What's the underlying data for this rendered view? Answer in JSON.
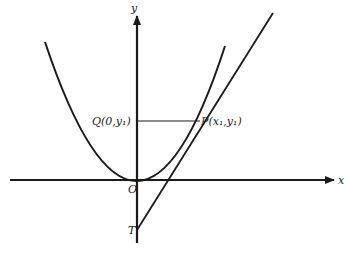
{
  "figure": {
    "type": "parabola-tangent-diagram",
    "labels": {
      "y_axis": "y",
      "x_axis": "x",
      "origin": "O",
      "point_q": "Q(0,y₁)",
      "point_p": "P(x₁,y₁)",
      "point_t": "T"
    },
    "colors": {
      "stroke": "#1a1a1a",
      "background": "#ffffff"
    }
  }
}
